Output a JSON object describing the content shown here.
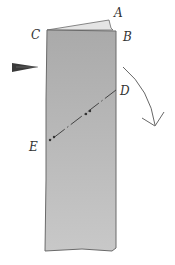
{
  "diagram": {
    "type": "origami-fold-step",
    "labels": {
      "A": "A",
      "B": "B",
      "C": "C",
      "D": "D",
      "E": "E"
    },
    "colors": {
      "paper": "#b8b8b8",
      "paper_edge": "#6a6a6a",
      "flap": "#e2e2e2",
      "ink": "#444444",
      "pointer": "#555555"
    },
    "elements": {
      "paper_strip": "rectangle-paper",
      "top_flap": "flap-A",
      "fold_line": "dash-dot fold line from D to E",
      "curved_arrow": "fold direction arrow",
      "pointer_arrow": "push/pointer arrow at left edge"
    }
  }
}
